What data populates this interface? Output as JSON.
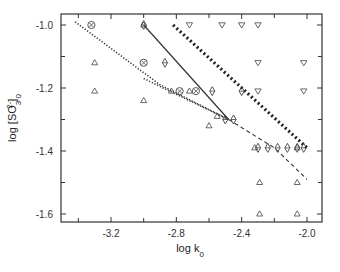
{
  "chart_data": {
    "type": "scatter",
    "title": "",
    "xlabel": "log k",
    "xlabel_sub": "0",
    "ylabel": "log [SO",
    "ylabel_sub": "3",
    "ylabel_sup": "2-",
    "ylabel_tail": "]",
    "ylabel_tail_sub": "0",
    "xlim": [
      -3.5,
      -1.9
    ],
    "ylim": [
      -1.66,
      -0.965
    ],
    "grid": false,
    "legend": null,
    "x_ticks": [
      -3.2,
      -2.8,
      -2.4,
      -2.0
    ],
    "x_tick_labels": [
      "-3.2",
      "-2.8",
      "-2.4",
      "-2.0"
    ],
    "x_minor_ticks": [
      -3.4,
      -3.0,
      -2.6,
      -2.2
    ],
    "y_ticks": [
      -1.0,
      -1.2,
      -1.4,
      -1.6
    ],
    "y_tick_labels": [
      "-1.0",
      "-1.2",
      "-1.4",
      "-1.6"
    ],
    "y_minor_ticks": [
      -1.1,
      -1.3,
      -1.5
    ],
    "series": [
      {
        "name": "triangle-up",
        "marker": "triangle-up",
        "points": [
          [
            -3.3,
            -1.12
          ],
          [
            -3.0,
            -1.0
          ],
          [
            -3.3,
            -1.21
          ],
          [
            -2.83,
            -1.21
          ],
          [
            -3.0,
            -1.24
          ],
          [
            -2.72,
            -1.21
          ],
          [
            -2.55,
            -1.29
          ],
          [
            -2.6,
            -1.32
          ],
          [
            -2.32,
            -1.39
          ],
          [
            -2.06,
            -1.39
          ],
          [
            -2.29,
            -1.5
          ],
          [
            -2.06,
            -1.5
          ],
          [
            -2.29,
            -1.6
          ],
          [
            -2.06,
            -1.6
          ]
        ]
      },
      {
        "name": "triangle-down",
        "marker": "triangle-down",
        "points": [
          [
            -2.72,
            -1.0
          ],
          [
            -2.52,
            -1.0
          ],
          [
            -2.4,
            -1.0
          ],
          [
            -2.3,
            -1.0
          ],
          [
            -2.3,
            -1.12
          ],
          [
            -2.02,
            -1.12
          ],
          [
            -2.3,
            -1.21
          ],
          [
            -2.02,
            -1.21
          ]
        ]
      },
      {
        "name": "circled-x",
        "marker": "circled-x",
        "points": [
          [
            -3.32,
            -1.0
          ],
          [
            -3.0,
            -1.12
          ],
          [
            -2.78,
            -1.21
          ],
          [
            -2.68,
            -1.21
          ]
        ]
      },
      {
        "name": "diamond-bar",
        "marker": "diamond",
        "points": [
          [
            -3.0,
            -1.0
          ],
          [
            -2.87,
            -1.12
          ],
          [
            -2.58,
            -1.21
          ],
          [
            -2.4,
            -1.21
          ],
          [
            -2.45,
            -1.3
          ],
          [
            -2.5,
            -1.3
          ],
          [
            -2.3,
            -1.39
          ],
          [
            -2.24,
            -1.39
          ],
          [
            -2.18,
            -1.39
          ],
          [
            -2.12,
            -1.39
          ],
          [
            -2.06,
            -1.39
          ],
          [
            -2.02,
            -1.39
          ]
        ]
      }
    ],
    "lines": [
      {
        "name": "dotted-upper-left",
        "style": "dotted",
        "points": [
          [
            -3.42,
            -0.99
          ],
          [
            -2.9,
            -1.19
          ],
          [
            -2.48,
            -1.3
          ]
        ]
      },
      {
        "name": "dotted-lower-left",
        "style": "dotted",
        "points": [
          [
            -3.0,
            -1.17
          ],
          [
            -2.8,
            -1.22
          ],
          [
            -2.48,
            -1.3
          ]
        ]
      },
      {
        "name": "solid",
        "style": "solid",
        "points": [
          [
            -3.0,
            -1.0
          ],
          [
            -2.48,
            -1.3
          ]
        ]
      },
      {
        "name": "thick-dotted",
        "style": "heavy-dotted",
        "points": [
          [
            -2.82,
            -1.0
          ],
          [
            -2.0,
            -1.39
          ]
        ]
      },
      {
        "name": "dashed",
        "style": "dashed",
        "points": [
          [
            -2.48,
            -1.3
          ],
          [
            -2.2,
            -1.39
          ],
          [
            -2.0,
            -1.49
          ]
        ]
      }
    ]
  }
}
